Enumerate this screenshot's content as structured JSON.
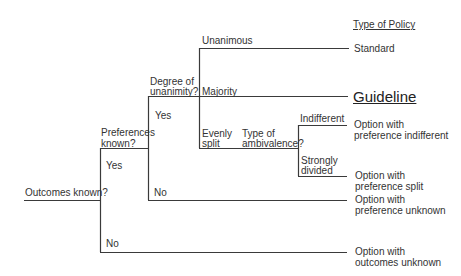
{
  "header": {
    "type_of_policy": "Type of Policy"
  },
  "nodes": {
    "outcomes_known": "Outcomes known?",
    "preferences_known": [
      "Preferences",
      "known?"
    ],
    "degree_of_unanimity": [
      "Degree of",
      "unanimity?"
    ],
    "type_of_ambivalence": [
      "Type of",
      "ambivalence?"
    ]
  },
  "branches": {
    "outcomes_yes": "Yes",
    "outcomes_no": "No",
    "preferences_yes": "Yes",
    "preferences_no": "No",
    "unanimous": "Unanimous",
    "majority": "Majority",
    "evenly_split": [
      "Evenly",
      "split"
    ],
    "indifferent": "Indifferent",
    "strongly_divided": [
      "Strongly",
      "divided"
    ]
  },
  "outcomes": {
    "standard": "Standard",
    "guideline": "Guideline",
    "pref_indifferent": [
      "Option with",
      "preference indifferent"
    ],
    "pref_split": [
      "Option with",
      "preference split"
    ],
    "pref_unknown": [
      "Option with",
      "preference unknown"
    ],
    "outcomes_unknown": [
      "Option with",
      "outcomes unknown"
    ]
  },
  "colors": {
    "line": "#3a3a3a",
    "text": "#333333"
  }
}
